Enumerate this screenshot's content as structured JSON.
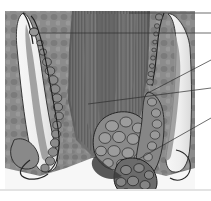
{
  "figure": {
    "rendering": "grayscale halftone anatomical illustration",
    "background_color": "#ffffff",
    "image_area": {
      "x": 5,
      "y": 11,
      "width": 190,
      "height": 178
    },
    "tones": {
      "darkest": "#3a3a3a",
      "dark": "#5c5c5c",
      "mid": "#7d7d7d",
      "light": "#a8a8a8",
      "lightest": "#d8d8d8",
      "highlight": "#f2f2f2",
      "ink": "#222222"
    },
    "rule": {
      "y": 190,
      "color": "#b9b9b9"
    }
  },
  "structures": [
    {
      "id": "internal-sphincter-column",
      "name": "Internal sphincter / striated muscle column",
      "tone": "#6e6e6e",
      "note": "central vertically striated mass"
    },
    {
      "id": "left-mucosal-fold",
      "name": "Left mucosal fold with submucosal lumen",
      "tone": "#f2f2f2"
    },
    {
      "id": "right-mucosal-fold",
      "name": "Right mucosal fold with submucosal lumen",
      "tone": "#f2f2f2"
    },
    {
      "id": "left-vascular-chain",
      "name": "Left vascular / glandular chain",
      "tone": "#8a8a8a"
    },
    {
      "id": "internal-haemorrhoid-mass",
      "name": "Internal haemorrhoidal cushion",
      "tone": "#8a8a8a"
    },
    {
      "id": "external-haemorrhoid-mass",
      "name": "External haemorrhoidal cushion",
      "tone": "#7a7a7a"
    },
    {
      "id": "perianal-skin-tag",
      "name": "Perianal lobulated mass",
      "tone": "#6a6a6a"
    }
  ],
  "leader_lines": [
    {
      "id": "leader-1",
      "x1": 129,
      "y1": 13,
      "x2": 211,
      "y2": 13,
      "label": ""
    },
    {
      "id": "leader-2",
      "x1": 40,
      "y1": 33,
      "x2": 211,
      "y2": 33,
      "label": ""
    },
    {
      "id": "leader-3",
      "x1": 146,
      "y1": 94,
      "x2": 211,
      "y2": 60,
      "label": ""
    },
    {
      "id": "leader-4",
      "x1": 88,
      "y1": 104,
      "x2": 211,
      "y2": 88,
      "label": ""
    },
    {
      "id": "leader-5",
      "x1": 137,
      "y1": 160,
      "x2": 211,
      "y2": 118,
      "label": ""
    }
  ],
  "leader_style": {
    "color": "#2e2e2e",
    "width": 0.7
  }
}
